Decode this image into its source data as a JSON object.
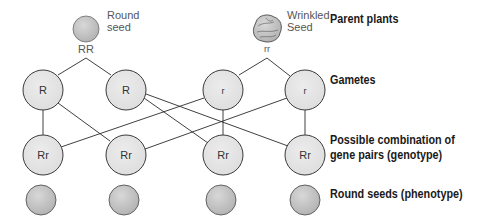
{
  "parents": {
    "round": {
      "label_line1": "Round",
      "label_line2": "seed",
      "genotype": "RR",
      "cx": 86,
      "cy": 29,
      "r": 13
    },
    "wrinkled": {
      "label_line1": "Wrinkled",
      "label_line2": "Seed",
      "genotype": "rr",
      "cx": 267,
      "cy": 29,
      "r": 13
    }
  },
  "gametes": [
    {
      "allele": "R",
      "cx": 43
    },
    {
      "allele": "R",
      "cx": 126
    },
    {
      "allele": "r",
      "cx": 223
    },
    {
      "allele": "r",
      "cx": 305
    }
  ],
  "genotypes": [
    {
      "genotype": "Rr",
      "cx": 43
    },
    {
      "genotype": "Rr",
      "cx": 126
    },
    {
      "genotype": "Rr",
      "cx": 223
    },
    {
      "genotype": "Rr",
      "cx": 305
    }
  ],
  "phenotypes": [
    {
      "phenotype": "round",
      "cx": 41
    },
    {
      "phenotype": "round",
      "cx": 124
    },
    {
      "phenotype": "round",
      "cx": 221
    },
    {
      "phenotype": "round",
      "cx": 305
    }
  ],
  "side_labels": {
    "parents": "Parent plants",
    "gametes": "Gametes",
    "genotype_line1": "Possible combination of",
    "genotype_line2": "gene pairs (genotype)",
    "phenotype": "Round seeds (phenotype)"
  },
  "colors": {
    "node_fill": "#e4e4e4",
    "seed_fill": "#c8c8c8",
    "stroke": "#3a3a3a"
  }
}
